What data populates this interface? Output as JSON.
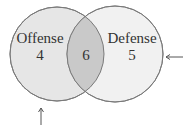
{
  "diagram": {
    "type": "venn",
    "sets": [
      {
        "label": "Offense",
        "only_value": "4",
        "fill": "#e4e4e4"
      },
      {
        "label": "Defense",
        "only_value": "5",
        "fill": "#f0f0f0"
      }
    ],
    "intersection_value": "6",
    "intersection_fill": "#c8c8c8",
    "stroke": "#777777",
    "arrows": [
      {
        "name": "right-arrow",
        "points_to": "Defense circle",
        "direction": "left"
      },
      {
        "name": "bottom-arrow",
        "points_to": "Offense circle",
        "direction": "up"
      }
    ]
  }
}
